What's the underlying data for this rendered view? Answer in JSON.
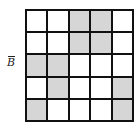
{
  "diagram": {
    "label": "B",
    "label_decoration": "overbar",
    "rows": 5,
    "cols": 5,
    "shade_color": "#d6d6d6",
    "cells": [
      [
        0,
        0,
        1,
        1,
        0
      ],
      [
        0,
        0,
        1,
        1,
        0
      ],
      [
        1,
        1,
        0,
        0,
        0
      ],
      [
        0,
        1,
        0,
        0,
        1
      ],
      [
        1,
        0,
        0,
        0,
        1
      ]
    ]
  }
}
